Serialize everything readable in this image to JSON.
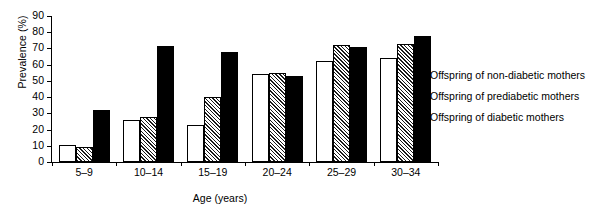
{
  "chart_data": {
    "type": "bar",
    "title": "",
    "xlabel": "Age (years)",
    "ylabel": "Prevalence (%)",
    "ylim": [
      0,
      90
    ],
    "yticks": [
      0,
      10,
      20,
      30,
      40,
      50,
      60,
      70,
      80,
      90
    ],
    "grid": false,
    "legend_position": "right",
    "categories": [
      "5–9",
      "10–14",
      "15–19",
      "20–24",
      "25–29",
      "30–34"
    ],
    "series": [
      {
        "name": "Offspring of non-diabetic mothers",
        "pattern": "white",
        "color": "#ffffff",
        "values": [
          10.5,
          26.0,
          23.0,
          54.0,
          62.0,
          64.0
        ]
      },
      {
        "name": "Offspring of prediabetic mothers",
        "pattern": "hatch",
        "color": "#808080",
        "values": [
          9.5,
          27.5,
          40.0,
          55.0,
          72.0,
          72.5
        ]
      },
      {
        "name": "Offspring of diabetic mothers",
        "pattern": "black",
        "color": "#000000",
        "values": [
          32.0,
          71.5,
          68.0,
          53.0,
          71.0,
          77.5
        ]
      }
    ]
  },
  "axis": {
    "y_title": "Prevalence (%)",
    "x_title": "Age (years)",
    "y_tick_labels": [
      "90",
      "80",
      "70",
      "60",
      "50",
      "40",
      "30",
      "20",
      "10",
      "0"
    ]
  },
  "legend": {
    "items": [
      {
        "label": "Offspring of non-diabetic mothers",
        "swatch": "white"
      },
      {
        "label": "Offspring of prediabetic mothers",
        "swatch": "hatch"
      },
      {
        "label": "Offspring of diabetic mothers",
        "swatch": "black"
      }
    ]
  }
}
